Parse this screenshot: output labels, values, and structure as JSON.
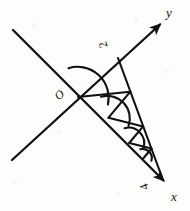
{
  "figure": {
    "kind": "geometry-diagram",
    "ink_color": "#111111",
    "background_color": "#fdfdfc",
    "labels": {
      "y_axis": "y",
      "x_axis": "x",
      "origin": "O",
      "y_point": "2",
      "x_point": "4"
    },
    "icons": {
      "y_arrowhead": "arrow-up-right-icon",
      "x_arrowhead": "arrow-down-right-icon"
    },
    "axes": [
      {
        "name": "y",
        "label": "y",
        "from": [
          12,
          160
        ],
        "to": [
          163,
          22
        ],
        "arrow_at_end": true
      },
      {
        "name": "x",
        "label": "x",
        "from": [
          13,
          30
        ],
        "to": [
          166,
          183
        ],
        "arrow_at_end": true
      }
    ],
    "origin_point": [
      78,
      97
    ],
    "marked_points": [
      {
        "label": "2",
        "on_axis": "y",
        "at": [
          118,
          58
        ]
      },
      {
        "label": "4",
        "on_axis": "x",
        "at": [
          163,
          180
        ]
      }
    ],
    "hypotenuse": {
      "from": [
        118,
        58
      ],
      "to": [
        163,
        180
      ]
    },
    "spiral_segments": [
      {
        "from": [
          78,
          97
        ],
        "to": [
          118.0,
          58.0
        ]
      },
      {
        "from": [
          78,
          97
        ],
        "to": [
          130.3,
          91.7
        ]
      },
      {
        "from": [
          130.3,
          91.7
        ],
        "to": [
          108.5,
          117.7
        ]
      },
      {
        "from": [
          108.5,
          117.7
        ],
        "to": [
          143.1,
          126.4
        ]
      },
      {
        "from": [
          143.1,
          126.4
        ],
        "to": [
          129.2,
          143.0
        ]
      },
      {
        "from": [
          129.2,
          143.0
        ],
        "to": [
          151.5,
          148.5
        ]
      },
      {
        "from": [
          151.5,
          148.5
        ],
        "to": [
          143.6,
          158.0
        ]
      }
    ],
    "angle_arcs": [
      {
        "vertex": [
          78,
          97
        ],
        "radius": 30,
        "size": "large"
      },
      {
        "vertex": [
          108.5,
          117.7
        ],
        "radius": 22,
        "size": "medium"
      },
      {
        "vertex": [
          129.2,
          143.0
        ],
        "radius": 15,
        "size": "small"
      },
      {
        "vertex": [
          143.6,
          158.0
        ],
        "radius": 9,
        "size": "tiny"
      }
    ]
  }
}
